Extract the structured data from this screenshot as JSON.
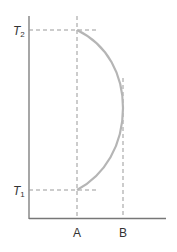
{
  "diagram": {
    "type": "temperature-composition curve",
    "y_labels": {
      "upper": {
        "main": "T",
        "sub": "2"
      },
      "lower": {
        "main": "T",
        "sub": "1"
      }
    },
    "x_labels": {
      "left": "A",
      "right": "B"
    },
    "colors": {
      "axis": "#777777",
      "curve": "#b5b5b5",
      "dashed": "#999999",
      "text": "#333333"
    }
  }
}
